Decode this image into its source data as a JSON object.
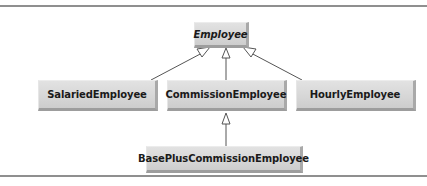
{
  "diagram": {
    "type": "UML class hierarchy",
    "classes": [
      {
        "id": "employee",
        "label": "Employee",
        "abstract": true
      },
      {
        "id": "salaried",
        "label": "SalariedEmployee",
        "abstract": false
      },
      {
        "id": "commission",
        "label": "CommissionEmployee",
        "abstract": false
      },
      {
        "id": "hourly",
        "label": "HourlyEmployee",
        "abstract": false
      },
      {
        "id": "basePlus",
        "label": "BasePlusCommissionEmployee",
        "abstract": false
      }
    ],
    "relationships": [
      {
        "from": "SalariedEmployee",
        "to": "Employee",
        "kind": "generalization"
      },
      {
        "from": "CommissionEmployee",
        "to": "Employee",
        "kind": "generalization"
      },
      {
        "from": "HourlyEmployee",
        "to": "Employee",
        "kind": "generalization"
      },
      {
        "from": "BasePlusCommissionEmployee",
        "to": "CommissionEmployee",
        "kind": "generalization"
      }
    ],
    "colors": {
      "box_fill": "#d8d8d8",
      "box_shadow": "#9d9d9d",
      "line": "#555555",
      "rule": "#8f8f8f"
    }
  }
}
